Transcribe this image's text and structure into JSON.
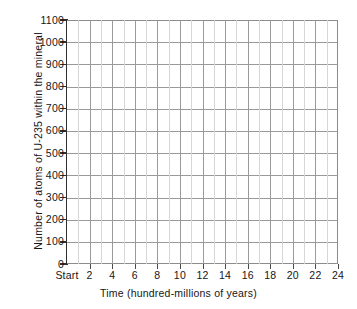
{
  "chart_data": {
    "type": "line",
    "title": "",
    "subtitle": "",
    "xlabel": "Time (hundred-millions of years)",
    "ylabel": "Number of atoms of U-235 within the mineral",
    "xlim": [
      0,
      24
    ],
    "ylim": [
      0,
      1100
    ],
    "grid": true,
    "legend": null,
    "series": [],
    "note": "Blank worksheet grid with no plotted data points.",
    "x_ticks": [
      {
        "value": 0,
        "label": "Start"
      },
      {
        "value": 2,
        "label": "2"
      },
      {
        "value": 4,
        "label": "4"
      },
      {
        "value": 6,
        "label": "6"
      },
      {
        "value": 8,
        "label": "8"
      },
      {
        "value": 10,
        "label": "10"
      },
      {
        "value": 12,
        "label": "12"
      },
      {
        "value": 14,
        "label": "14"
      },
      {
        "value": 16,
        "label": "16"
      },
      {
        "value": 18,
        "label": "18"
      },
      {
        "value": 20,
        "label": "20"
      },
      {
        "value": 22,
        "label": "22"
      },
      {
        "value": 24,
        "label": "24"
      }
    ],
    "x_minor_ticks": [
      1,
      3,
      5,
      7,
      9,
      11,
      13,
      15,
      17,
      19,
      21,
      23
    ],
    "y_ticks": [
      {
        "value": 0,
        "label": "0"
      },
      {
        "value": 100,
        "label": "100"
      },
      {
        "value": 200,
        "label": "200"
      },
      {
        "value": 300,
        "label": "300"
      },
      {
        "value": 400,
        "label": "400"
      },
      {
        "value": 500,
        "label": "500"
      },
      {
        "value": 600,
        "label": "600"
      },
      {
        "value": 700,
        "label": "700"
      },
      {
        "value": 800,
        "label": "800"
      },
      {
        "value": 900,
        "label": "900"
      },
      {
        "value": 1000,
        "label": "1000"
      },
      {
        "value": 1100,
        "label": "1100"
      }
    ],
    "colors": {
      "background": "#ffffff",
      "grid_major": "#9a9a9a",
      "grid_minor": "#d6d6d6",
      "axis": "#2e2e2e",
      "text": "#161616"
    }
  }
}
